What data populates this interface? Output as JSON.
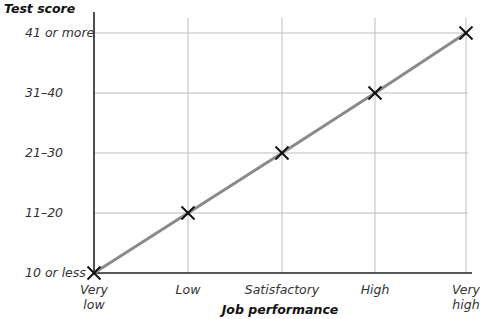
{
  "chart_data": {
    "type": "line",
    "title": "",
    "xlabel": "Job performance",
    "ylabel": "Test score",
    "categories": [
      "Very low",
      "Low",
      "Satisfactory",
      "High",
      "Very high"
    ],
    "x_tick_lines": [
      [
        "Very",
        "low"
      ],
      [
        "Low"
      ],
      [
        "Satisfactory"
      ],
      [
        "High"
      ],
      [
        "Very",
        "high"
      ]
    ],
    "y_categories": [
      "10 or less",
      "11–20",
      "21–30",
      "31–40",
      "41 or more"
    ],
    "series": [
      {
        "name": "Test score vs job performance",
        "values": [
          "10 or less",
          "11–20",
          "21–30",
          "31–40",
          "41 or more"
        ],
        "value_index": [
          0,
          1,
          2,
          3,
          4
        ],
        "marker": "x",
        "line_color": "#8a8a8a",
        "marker_color": "#111111"
      }
    ],
    "grid": true,
    "legend": "none"
  },
  "colors": {
    "axis": "#222222",
    "grid": "#bdbdbd",
    "line": "#8a8a8a",
    "marker": "#111111"
  }
}
